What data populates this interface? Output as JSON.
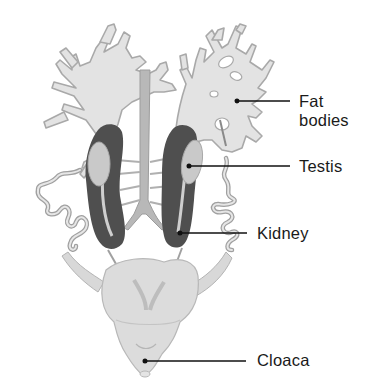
{
  "figure": {
    "colors": {
      "background": "#ffffff",
      "fat_body_fill": "#e3e3e3",
      "fat_body_stroke": "#a9a9a9",
      "kidney_fill": "#4f4f4f",
      "testis_fill": "#c9c9c9",
      "vessel_fill": "#b8b8b8",
      "cloaca_fill": "#dcdcdc",
      "leader_line": "#111111",
      "label_text": "#1a1a1a"
    }
  },
  "labels": [
    {
      "id": "fat-bodies",
      "lines": [
        "Fat",
        "bodies"
      ]
    },
    {
      "id": "testis",
      "lines": [
        "Testis"
      ]
    },
    {
      "id": "kidney",
      "lines": [
        "Kidney"
      ]
    },
    {
      "id": "cloaca",
      "lines": [
        "Cloaca"
      ]
    }
  ]
}
